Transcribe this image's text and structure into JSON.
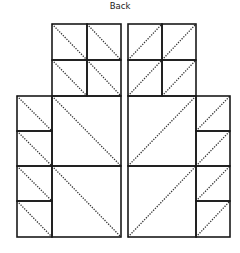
{
  "diagram": {
    "title": "Back",
    "type": "quilt-block-layout",
    "panels": [
      {
        "name": "left-panel",
        "diagonal_direction": "top-left-to-bottom-right",
        "pieces": [
          {
            "kind": "small-square",
            "x": 52,
            "y": 24,
            "w": 35,
            "h": 36
          },
          {
            "kind": "small-square",
            "x": 87,
            "y": 24,
            "w": 34,
            "h": 36
          },
          {
            "kind": "small-square",
            "x": 52,
            "y": 60,
            "w": 35,
            "h": 36
          },
          {
            "kind": "small-square",
            "x": 87,
            "y": 60,
            "w": 34,
            "h": 36
          },
          {
            "kind": "side-square",
            "x": 17,
            "y": 96,
            "w": 35,
            "h": 35
          },
          {
            "kind": "side-square",
            "x": 17,
            "y": 131,
            "w": 35,
            "h": 35
          },
          {
            "kind": "side-square",
            "x": 17,
            "y": 166,
            "w": 35,
            "h": 35
          },
          {
            "kind": "side-square",
            "x": 17,
            "y": 201,
            "w": 35,
            "h": 36
          },
          {
            "kind": "large-square",
            "x": 52,
            "y": 96,
            "w": 69,
            "h": 70
          },
          {
            "kind": "large-square",
            "x": 52,
            "y": 166,
            "w": 69,
            "h": 71
          }
        ]
      },
      {
        "name": "right-panel",
        "diagonal_direction": "bottom-left-to-top-right",
        "pieces": [
          {
            "kind": "small-square",
            "x": 128,
            "y": 24,
            "w": 34,
            "h": 36
          },
          {
            "kind": "small-square",
            "x": 162,
            "y": 24,
            "w": 34,
            "h": 36
          },
          {
            "kind": "small-square",
            "x": 128,
            "y": 60,
            "w": 34,
            "h": 36
          },
          {
            "kind": "small-square",
            "x": 162,
            "y": 60,
            "w": 34,
            "h": 36
          },
          {
            "kind": "side-square",
            "x": 196,
            "y": 96,
            "w": 34,
            "h": 35
          },
          {
            "kind": "side-square",
            "x": 196,
            "y": 131,
            "w": 34,
            "h": 35
          },
          {
            "kind": "side-square",
            "x": 196,
            "y": 166,
            "w": 34,
            "h": 35
          },
          {
            "kind": "side-square",
            "x": 196,
            "y": 201,
            "w": 34,
            "h": 36
          },
          {
            "kind": "large-square",
            "x": 128,
            "y": 96,
            "w": 68,
            "h": 70
          },
          {
            "kind": "large-square",
            "x": 128,
            "y": 166,
            "w": 68,
            "h": 71
          }
        ]
      }
    ],
    "colors": {
      "edge": "#1a1a1a",
      "fold": "#333333",
      "background": "#ffffff"
    }
  }
}
